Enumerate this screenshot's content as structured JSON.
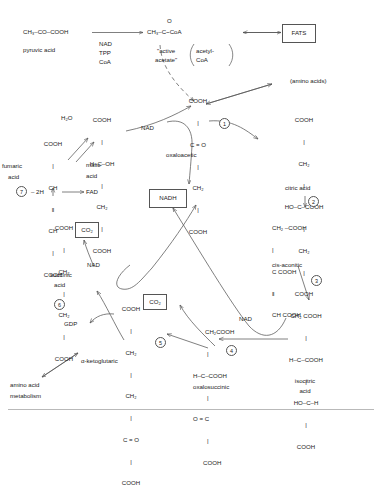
{
  "diagram": {
    "line_color": "#555555",
    "text_color": "#1a1a1a",
    "background": "#ffffff"
  },
  "nodes": {
    "pyruvic": {
      "formula": "CH₃–CO–COOH",
      "name": "pyruvic acid"
    },
    "acetyl_coa": {
      "formula_top": "O",
      "formula": "CH₃–C~CoA",
      "quoted_name_line1": "\"active",
      "quoted_name_line2": "acetate\"",
      "paren_line1": "acetyl-",
      "paren_line2": "CoA"
    },
    "cofactors": {
      "line1": "NAD",
      "line2": "TPP",
      "line3": "CoA"
    },
    "fats": {
      "label": "FATS"
    },
    "amino_acids_top": {
      "label": "(amino acids)"
    },
    "oxaloacetic": {
      "rows": [
        "COOH",
        "C = O",
        "CH₂",
        "COOH"
      ],
      "name": "oxaloacetic"
    },
    "citric": {
      "rows": [
        "COOH",
        "CH₂",
        "HO–C–COOH",
        "CH₂",
        "COOH"
      ],
      "name": "citric acid"
    },
    "cis_aconitic": {
      "rows": [
        "CH₂ –COOH",
        "C COOH",
        "CH COOH"
      ],
      "name": "cis-aconitic"
    },
    "isocitric": {
      "rows": [
        "CH₂ COOH",
        "H–C–COOH",
        "HO–C–H",
        "COOH"
      ],
      "name_line1": "isocitric",
      "name_line2": "acid"
    },
    "oxalosuccinic": {
      "rows": [
        "CH₂COOH",
        "H–C–COOH",
        "O = C",
        "COOH"
      ],
      "name": "oxalosuccinic"
    },
    "alpha_ketoglutaric": {
      "rows": [
        "COOH",
        "CH₂",
        "CH₂",
        "C = O",
        "COOH"
      ],
      "name": "α-ketoglutaric"
    },
    "succinic": {
      "rows": [
        "COOH",
        "CH₂",
        "CH₂",
        "COOH"
      ],
      "name_line1": "succinic",
      "name_line2": "acid"
    },
    "fumaric": {
      "rows": [
        "COOH",
        "CH",
        "CH",
        "COOH"
      ],
      "name_line1": "fumaric",
      "name_line2": "acid"
    },
    "malic": {
      "rows": [
        "COOH",
        "H–C–OH",
        "CH₂",
        "COOH"
      ],
      "name_line1": "malic",
      "name_line2": "acid"
    },
    "amino_acid_metabolism": {
      "line1": "amino acid",
      "line2": "metabolism"
    }
  },
  "cofactor_labels": {
    "nad_malate": "NAD",
    "nad_succinate": "NAD",
    "nad_isocitrate": "NAD",
    "nadh_box": "NADH",
    "fad": "FAD",
    "minus_2h": "– 2H",
    "gdp": "GDP",
    "water": "H₂O",
    "co2_box_1": "CO₂",
    "co2_box_2": "CO₂"
  },
  "step_numbers": {
    "step1": "1",
    "step2": "2",
    "step3": "3",
    "step4": "4",
    "step5": "5",
    "step6": "6",
    "step7": "7"
  }
}
